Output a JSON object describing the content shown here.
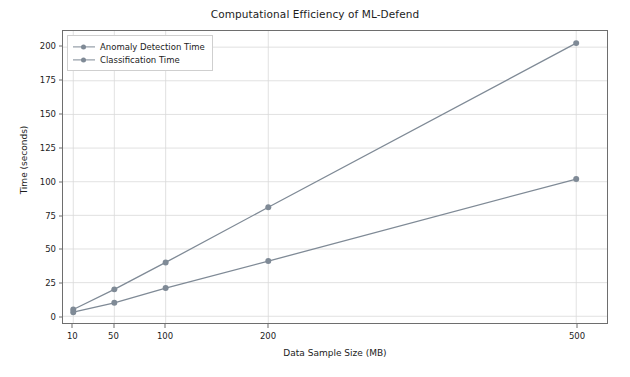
{
  "chart_data": {
    "type": "line",
    "title": "Computational Efficiency of ML-Defend",
    "xlabel": "Data Sample Size (MB)",
    "ylabel": "Time (seconds)",
    "x": [
      10,
      50,
      100,
      200,
      500
    ],
    "xticklabels": [
      "10",
      "50",
      "100",
      "200",
      "500"
    ],
    "yticks": [
      0,
      25,
      50,
      75,
      100,
      125,
      150,
      175,
      200
    ],
    "yticklabels": [
      "0",
      "25",
      "50",
      "75",
      "100",
      "125",
      "150",
      "175",
      "200"
    ],
    "xlim": [
      0,
      530
    ],
    "ylim": [
      -5,
      212
    ],
    "grid": true,
    "legend_position": "upper left",
    "series": [
      {
        "name": "Anomaly Detection Time",
        "values": [
          5,
          20,
          40,
          81,
          203
        ],
        "color": "#7f8a96",
        "marker": "circle"
      },
      {
        "name": "Classification Time",
        "values": [
          3,
          10,
          21,
          41,
          102
        ],
        "color": "#7f8a96",
        "marker": "circle"
      }
    ]
  }
}
